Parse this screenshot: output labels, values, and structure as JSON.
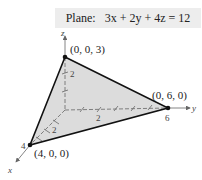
{
  "title": "Plane:   3x + 2y + 4z = 12",
  "axes": {
    "x": "x",
    "y": "y",
    "z": "z"
  },
  "points": [
    {
      "label": "(0, 0, 3)",
      "coords": [
        0,
        0,
        3
      ]
    },
    {
      "label": "(0, 6, 0)",
      "coords": [
        0,
        6,
        0
      ]
    },
    {
      "label": "(4, 0, 0)",
      "coords": [
        4,
        0,
        0
      ]
    }
  ],
  "ticks": {
    "z": "2",
    "y_mid": "2",
    "y_end": "6",
    "x_mid": "2",
    "x_end": "4"
  },
  "colors": {
    "plane_fill": "#dcdcdc",
    "edge": "#111111",
    "axis": "#666666",
    "label_bg": "#ededed"
  }
}
